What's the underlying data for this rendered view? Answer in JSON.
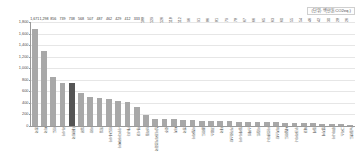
{
  "unit_caption": "(단위: 백만톤CO2eq.)",
  "chart_data": {
    "type": "bar",
    "title": "",
    "xlabel": "",
    "ylabel": "",
    "ylim": [
      0,
      1800
    ],
    "grid": true,
    "legend": "none",
    "unit": "(단위: 백만톤CO2eq.)",
    "highlight_index": 4,
    "highlight_color": "#555555",
    "bar_color": "#a8a8a8",
    "ytick_labels": [
      "1,800",
      "1,600",
      "1,400",
      "1,200",
      "1,000",
      "800",
      "600",
      "400",
      "200",
      "0"
    ],
    "ytick_values": [
      1800,
      1600,
      1400,
      1200,
      1000,
      800,
      600,
      400,
      200,
      0
    ],
    "categories": [
      "중국",
      "미국",
      "인도",
      "러시아",
      "대한민국",
      "일본",
      "이란",
      "독일",
      "인도네시아",
      "사우디아라비아",
      "캐나다",
      "멕시코",
      "브라질",
      "남아프리카공화국",
      "호주",
      "터키",
      "영국",
      "이탈리아",
      "폴란드",
      "프랑스",
      "태국",
      "카자흐스탄",
      "말레이시아",
      "스페인",
      "이집트",
      "아르헨티나",
      "파키스탄",
      "네덜란드",
      "우크라이나",
      "체코",
      "칠레",
      "벨기에",
      "루마니아",
      "그리스",
      "뉴질랜드"
    ],
    "values": [
      1671,
      1298,
      856,
      739,
      738,
      568,
      507,
      487,
      462,
      429,
      412,
      333,
      188,
      129,
      126,
      118,
      112,
      96,
      91,
      86,
      81,
      79,
      78,
      67,
      66,
      65,
      63,
      60,
      55,
      54,
      46,
      42,
      30,
      28,
      26
    ],
    "value_labels": [
      "1,671",
      "1,298",
      "856",
      "739",
      "738",
      "568",
      "507",
      "487",
      "462",
      "429",
      "412",
      "333",
      "188",
      "129",
      "126",
      "118",
      "112",
      "96",
      "91",
      "86",
      "81",
      "79",
      "78",
      "67",
      "66",
      "65",
      "63",
      "60",
      "55",
      "54",
      "46",
      "42",
      "30",
      "28",
      "26"
    ]
  }
}
